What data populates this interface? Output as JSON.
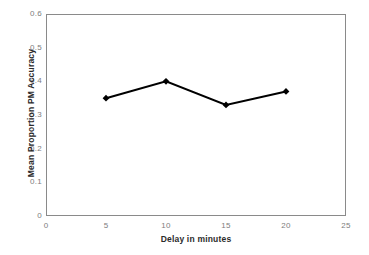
{
  "chart_data": {
    "type": "line",
    "title": "",
    "xlabel": "Delay in minutes",
    "ylabel": "Mean Proportion PM Accuracy",
    "x": [
      5,
      10,
      15,
      20
    ],
    "values": [
      0.35,
      0.4,
      0.33,
      0.37
    ],
    "series": [
      {
        "name": "Mean Proportion PM Accuracy",
        "x": [
          5,
          10,
          15,
          20
        ],
        "values": [
          0.35,
          0.4,
          0.33,
          0.37
        ]
      }
    ],
    "xlim": [
      0,
      25
    ],
    "ylim": [
      0,
      0.6
    ],
    "xticks": [
      0,
      5,
      10,
      15,
      20,
      25
    ],
    "yticks": [
      0,
      0.1,
      0.2,
      0.3,
      0.4,
      0.5,
      0.6
    ],
    "xtick_labels": [
      "0",
      "5",
      "10",
      "15",
      "20",
      "25"
    ],
    "ytick_labels": [
      "0",
      "0.1",
      "0.2",
      "0.3",
      "0.4",
      "0.5",
      "0.6"
    ],
    "grid": false,
    "legend": false,
    "legend_position": "none",
    "marker": "diamond",
    "line_color": "#000000",
    "marker_color": "#000000",
    "frame_color": "#8a8a8a",
    "tick_label_color": "#7d7d7d",
    "axis_title_color": "#2b2b2b",
    "background_color": "#ffffff"
  }
}
